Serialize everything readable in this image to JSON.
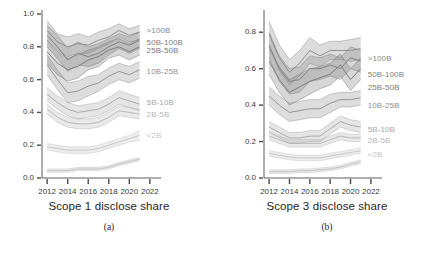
{
  "figure": {
    "panels": [
      {
        "key": "a",
        "caption": "Scope 1 disclose share",
        "subfig": "(a)"
      },
      {
        "key": "b",
        "caption": "Scope 3 disclose share",
        "subfig": "(b)"
      }
    ]
  },
  "chart_data": [
    {
      "type": "line",
      "panel": "(a)",
      "title": "Scope 1 disclose share",
      "xlabel": "",
      "ylabel": "",
      "grid": false,
      "legend": "inline-right-labels",
      "xlim": [
        2011.5,
        2022.5
      ],
      "ylim": [
        0.0,
        1.0
      ],
      "xticks": [
        2012,
        2014,
        2016,
        2018,
        2020,
        2022
      ],
      "yticks": [
        "0.0",
        "0.2",
        "0.4",
        "0.6",
        "0.8",
        "1.0"
      ],
      "x": [
        2012,
        2013,
        2014,
        2015,
        2016,
        2017,
        2018,
        2019,
        2020,
        2021
      ],
      "series": [
        {
          "name": ">100B",
          "color": "#8a8a8a",
          "values": [
            0.9,
            0.83,
            0.8,
            0.82,
            0.81,
            0.84,
            0.86,
            0.9,
            0.87,
            0.89
          ],
          "lower": [
            0.84,
            0.78,
            0.74,
            0.76,
            0.76,
            0.79,
            0.82,
            0.86,
            0.83,
            0.84
          ],
          "upper": [
            0.96,
            0.88,
            0.86,
            0.88,
            0.86,
            0.89,
            0.91,
            0.94,
            0.91,
            0.93
          ]
        },
        {
          "name": "50B-100B",
          "color": "#808080",
          "values": [
            0.87,
            0.8,
            0.72,
            0.76,
            0.74,
            0.76,
            0.8,
            0.83,
            0.81,
            0.84
          ],
          "lower": [
            0.8,
            0.73,
            0.65,
            0.69,
            0.68,
            0.7,
            0.75,
            0.79,
            0.76,
            0.79
          ],
          "upper": [
            0.93,
            0.87,
            0.79,
            0.83,
            0.8,
            0.82,
            0.85,
            0.88,
            0.86,
            0.89
          ]
        },
        {
          "name": "25B-50B",
          "color": "#7a7a7a",
          "values": [
            0.77,
            0.7,
            0.66,
            0.68,
            0.72,
            0.74,
            0.78,
            0.8,
            0.77,
            0.8
          ],
          "lower": [
            0.7,
            0.63,
            0.59,
            0.61,
            0.66,
            0.68,
            0.73,
            0.75,
            0.72,
            0.75
          ],
          "upper": [
            0.84,
            0.77,
            0.73,
            0.75,
            0.78,
            0.8,
            0.83,
            0.85,
            0.82,
            0.85
          ]
        },
        {
          "name": "10B-25B",
          "color": "#909090",
          "values": [
            0.69,
            0.6,
            0.52,
            0.53,
            0.56,
            0.58,
            0.62,
            0.65,
            0.63,
            0.66
          ],
          "lower": [
            0.63,
            0.54,
            0.46,
            0.47,
            0.5,
            0.53,
            0.57,
            0.6,
            0.58,
            0.61
          ],
          "upper": [
            0.75,
            0.66,
            0.58,
            0.59,
            0.62,
            0.63,
            0.67,
            0.7,
            0.68,
            0.71
          ]
        },
        {
          "name": "5B-10B",
          "color": "#a8a8a8",
          "values": [
            0.51,
            0.46,
            0.42,
            0.4,
            0.41,
            0.42,
            0.45,
            0.49,
            0.47,
            0.45
          ],
          "lower": [
            0.47,
            0.42,
            0.38,
            0.36,
            0.37,
            0.38,
            0.41,
            0.45,
            0.43,
            0.41
          ],
          "upper": [
            0.55,
            0.5,
            0.46,
            0.44,
            0.45,
            0.46,
            0.49,
            0.53,
            0.51,
            0.49
          ]
        },
        {
          "name": "2B-5B",
          "color": "#b5b5b5",
          "values": [
            0.42,
            0.37,
            0.34,
            0.33,
            0.33,
            0.34,
            0.37,
            0.41,
            0.4,
            0.39
          ],
          "lower": [
            0.39,
            0.34,
            0.31,
            0.3,
            0.3,
            0.31,
            0.34,
            0.38,
            0.37,
            0.36
          ],
          "upper": [
            0.45,
            0.4,
            0.37,
            0.36,
            0.36,
            0.37,
            0.4,
            0.44,
            0.43,
            0.42
          ]
        },
        {
          "name": "<2B",
          "color": "#c4c4c4",
          "values": [
            0.19,
            0.18,
            0.17,
            0.17,
            0.17,
            0.18,
            0.2,
            0.22,
            0.24,
            0.26
          ],
          "lower": [
            0.17,
            0.16,
            0.15,
            0.15,
            0.15,
            0.16,
            0.18,
            0.2,
            0.22,
            0.23
          ],
          "upper": [
            0.21,
            0.2,
            0.19,
            0.19,
            0.19,
            0.2,
            0.22,
            0.24,
            0.26,
            0.29
          ]
        },
        {
          "name": "baseline",
          "color": "#bfbfbf",
          "values": [
            0.045,
            0.045,
            0.045,
            0.055,
            0.055,
            0.055,
            0.065,
            0.085,
            0.1,
            0.115
          ],
          "lower": [
            0.035,
            0.035,
            0.035,
            0.045,
            0.045,
            0.045,
            0.055,
            0.075,
            0.09,
            0.105
          ],
          "upper": [
            0.055,
            0.055,
            0.055,
            0.065,
            0.065,
            0.065,
            0.075,
            0.095,
            0.11,
            0.125
          ]
        }
      ]
    },
    {
      "type": "line",
      "panel": "(b)",
      "title": "Scope 3 disclose share",
      "xlabel": "",
      "ylabel": "",
      "grid": false,
      "legend": "inline-right-labels",
      "xlim": [
        2011.5,
        2022.5
      ],
      "ylim": [
        0.0,
        0.9
      ],
      "xticks": [
        2012,
        2014,
        2016,
        2018,
        2020,
        2022
      ],
      "yticks": [
        "0.0",
        "0.2",
        "0.4",
        "0.6",
        "0.8"
      ],
      "x": [
        2012,
        2013,
        2014,
        2015,
        2016,
        2017,
        2018,
        2019,
        2020,
        2021
      ],
      "series": [
        {
          "name": ">100B",
          "color": "#8a8a8a",
          "values": [
            0.79,
            0.66,
            0.58,
            0.63,
            0.7,
            0.67,
            0.7,
            0.7,
            0.7,
            0.71
          ],
          "lower": [
            0.72,
            0.59,
            0.51,
            0.56,
            0.63,
            0.61,
            0.65,
            0.65,
            0.64,
            0.65
          ],
          "upper": [
            0.86,
            0.73,
            0.65,
            0.7,
            0.77,
            0.73,
            0.75,
            0.75,
            0.76,
            0.77
          ]
        },
        {
          "name": "50B-100B",
          "color": "#808080",
          "values": [
            0.73,
            0.6,
            0.53,
            0.54,
            0.6,
            0.6,
            0.62,
            0.6,
            0.66,
            0.64
          ],
          "lower": [
            0.66,
            0.53,
            0.46,
            0.47,
            0.53,
            0.54,
            0.56,
            0.54,
            0.6,
            0.58
          ],
          "upper": [
            0.8,
            0.67,
            0.6,
            0.61,
            0.67,
            0.66,
            0.68,
            0.66,
            0.72,
            0.7
          ]
        },
        {
          "name": "25B-50B",
          "color": "#7a7a7a",
          "values": [
            0.64,
            0.54,
            0.47,
            0.5,
            0.53,
            0.55,
            0.57,
            0.62,
            0.54,
            0.6
          ],
          "lower": [
            0.57,
            0.47,
            0.4,
            0.43,
            0.46,
            0.49,
            0.51,
            0.56,
            0.48,
            0.54
          ],
          "upper": [
            0.71,
            0.61,
            0.54,
            0.57,
            0.6,
            0.61,
            0.63,
            0.68,
            0.6,
            0.66
          ]
        },
        {
          "name": "10B-25B",
          "color": "#909090",
          "values": [
            0.45,
            0.4,
            0.36,
            0.37,
            0.38,
            0.38,
            0.41,
            0.43,
            0.43,
            0.44
          ],
          "lower": [
            0.4,
            0.35,
            0.31,
            0.32,
            0.33,
            0.33,
            0.36,
            0.39,
            0.39,
            0.4
          ],
          "upper": [
            0.5,
            0.45,
            0.41,
            0.42,
            0.43,
            0.43,
            0.46,
            0.47,
            0.47,
            0.48
          ]
        },
        {
          "name": "5B-10B",
          "color": "#a8a8a8",
          "values": [
            0.28,
            0.25,
            0.22,
            0.22,
            0.23,
            0.23,
            0.27,
            0.31,
            0.29,
            0.28
          ],
          "lower": [
            0.25,
            0.22,
            0.19,
            0.19,
            0.2,
            0.2,
            0.24,
            0.28,
            0.26,
            0.25
          ],
          "upper": [
            0.31,
            0.28,
            0.25,
            0.25,
            0.26,
            0.26,
            0.3,
            0.34,
            0.32,
            0.31
          ]
        },
        {
          "name": "2B-5B",
          "color": "#b5b5b5",
          "values": [
            0.23,
            0.21,
            0.19,
            0.19,
            0.19,
            0.19,
            0.21,
            0.23,
            0.22,
            0.22
          ],
          "lower": [
            0.21,
            0.19,
            0.17,
            0.17,
            0.17,
            0.17,
            0.19,
            0.21,
            0.2,
            0.2
          ],
          "upper": [
            0.25,
            0.23,
            0.21,
            0.21,
            0.21,
            0.21,
            0.23,
            0.25,
            0.24,
            0.24
          ]
        },
        {
          "name": "<2B",
          "color": "#c4c4c4",
          "values": [
            0.135,
            0.125,
            0.115,
            0.11,
            0.11,
            0.11,
            0.12,
            0.13,
            0.14,
            0.15
          ],
          "lower": [
            0.12,
            0.11,
            0.1,
            0.095,
            0.095,
            0.095,
            0.105,
            0.115,
            0.125,
            0.135
          ],
          "upper": [
            0.15,
            0.14,
            0.13,
            0.125,
            0.125,
            0.125,
            0.135,
            0.145,
            0.155,
            0.165
          ]
        },
        {
          "name": "baseline",
          "color": "#bfbfbf",
          "values": [
            0.035,
            0.035,
            0.035,
            0.04,
            0.04,
            0.045,
            0.05,
            0.06,
            0.075,
            0.09
          ],
          "lower": [
            0.025,
            0.025,
            0.025,
            0.03,
            0.03,
            0.035,
            0.04,
            0.05,
            0.065,
            0.08
          ],
          "upper": [
            0.045,
            0.045,
            0.045,
            0.05,
            0.05,
            0.055,
            0.06,
            0.07,
            0.085,
            0.1
          ]
        }
      ],
      "series_label_positions": {
        ">100B": 0.655,
        "50B-100B": 0.565,
        "25B-50B": 0.495,
        "10B-25B": 0.395,
        "5B-10B": 0.265,
        "2B-5B": 0.205,
        "<2B": 0.125
      }
    }
  ]
}
